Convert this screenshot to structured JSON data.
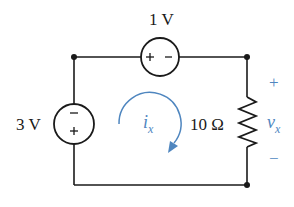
{
  "circuit": {
    "top_source": {
      "label": "1 V",
      "plus": "+",
      "minus": "−"
    },
    "left_source": {
      "label": "3 V",
      "plus": "+",
      "minus": "−"
    },
    "resistor": {
      "label": "10 Ω"
    },
    "current": {
      "symbol": "i",
      "subscript": "x",
      "direction": "clockwise"
    },
    "voltage": {
      "symbol": "v",
      "subscript": "x",
      "plus": "+",
      "minus": "−"
    }
  },
  "colors": {
    "wire": "#1a1a1a",
    "annotation": "#4f86bf"
  }
}
